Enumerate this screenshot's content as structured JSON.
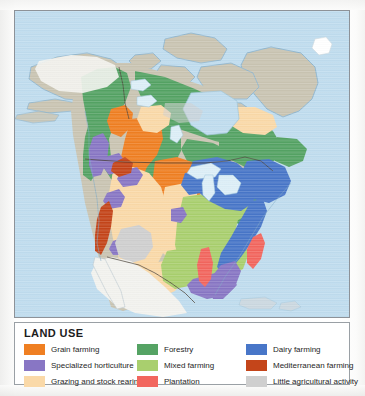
{
  "figure": {
    "kind": "thematic-map",
    "region": "North America",
    "map_background_color": "#bfdcee",
    "land_neutral_color": "#c9c4b2",
    "unclassified_land_color": "#f2f2ee",
    "border_line_color": "#5a5248"
  },
  "legend": {
    "title": "LAND USE",
    "columns": [
      {
        "name": "legend-column-1",
        "items": [
          {
            "label": "Grain farming",
            "color": "#ef7f22"
          },
          {
            "label": "Specialized horticulture",
            "color": "#8876c4"
          },
          {
            "label": "Grazing and stock rearing",
            "color": "#fad9a8"
          }
        ]
      },
      {
        "name": "legend-column-2",
        "items": [
          {
            "label": "Forestry",
            "color": "#55a364"
          },
          {
            "label": "Mixed farming",
            "color": "#a9cf6e"
          },
          {
            "label": "Plantation",
            "color": "#f2665e"
          }
        ]
      },
      {
        "name": "legend-column-3",
        "items": [
          {
            "label": "Dairy farming",
            "color": "#4876c8"
          },
          {
            "label": "Mediterranean farming",
            "color": "#c4451a"
          },
          {
            "label": "Little agricultural activity",
            "color": "#cfcfcf"
          }
        ]
      }
    ]
  },
  "map_features": {
    "ocean_label": "ocean",
    "greenland_label": "Greenland ice sheet",
    "classes_present": [
      "Grain farming",
      "Specialized horticulture",
      "Grazing and stock rearing",
      "Forestry",
      "Mixed farming",
      "Plantation",
      "Dairy farming",
      "Mediterranean farming",
      "Little agricultural activity"
    ]
  }
}
